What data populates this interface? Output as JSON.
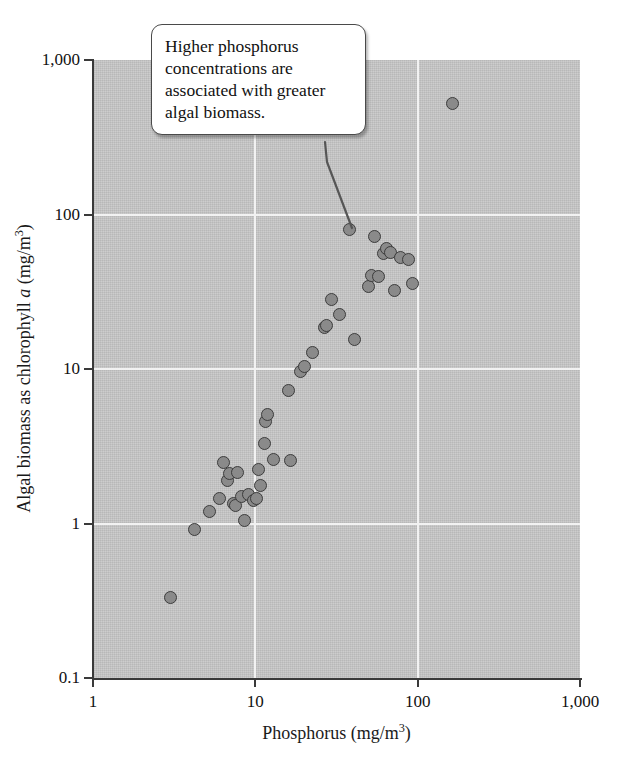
{
  "callout": {
    "text": "Higher phosphorus concentrations are associated with greater algal biomass."
  },
  "axes": {
    "x_title_main": "Phosphorus (mg/m",
    "x_title_sup": "3",
    "x_title_tail": ")",
    "y_title_a": "Algal biomass as chlorophyll ",
    "y_title_ital": "a",
    "y_title_b": " (mg/m",
    "y_title_sup": "3",
    "y_title_tail": ")",
    "x_ticks": [
      "1",
      "10",
      "100",
      "1,000"
    ],
    "y_ticks": [
      "1,000",
      "100",
      "10",
      "1",
      "0.1"
    ]
  },
  "colors": {
    "panel": "#c8c8c8",
    "gridline": "#f2f2f2",
    "marker_fill": "#8a8a8a",
    "marker_edge": "#3c3c3c",
    "axis": "#3a3a3a",
    "callout_bg": "#ffffff",
    "callout_border": "#4a4a4a",
    "text": "#111111"
  },
  "chart_data": {
    "type": "scatter",
    "title": "",
    "xlabel": "Phosphorus (mg/m3)",
    "ylabel": "Algal biomass as chlorophyll a (mg/m3)",
    "xscale": "log",
    "yscale": "log",
    "xlim": [
      1,
      1000
    ],
    "ylim": [
      0.1,
      1000
    ],
    "x_ticks": [
      1,
      10,
      100,
      1000
    ],
    "y_ticks": [
      0.1,
      1,
      10,
      100,
      1000
    ],
    "grid": true,
    "legend": "none",
    "series": [
      {
        "name": "Lakes",
        "points": [
          [
            3.0,
            0.33
          ],
          [
            4.2,
            0.92
          ],
          [
            5.2,
            1.2
          ],
          [
            6.0,
            1.45
          ],
          [
            6.4,
            2.5
          ],
          [
            6.7,
            1.9
          ],
          [
            6.9,
            2.1
          ],
          [
            7.3,
            1.35
          ],
          [
            7.6,
            1.3
          ],
          [
            7.8,
            2.15
          ],
          [
            8.2,
            1.5
          ],
          [
            8.6,
            1.05
          ],
          [
            9.1,
            1.55
          ],
          [
            9.8,
            1.4
          ],
          [
            10.2,
            1.45
          ],
          [
            10.5,
            2.25
          ],
          [
            10.8,
            1.75
          ],
          [
            11.4,
            3.3
          ],
          [
            11.6,
            4.6
          ],
          [
            11.9,
            5.1
          ],
          [
            13.0,
            2.6
          ],
          [
            16.5,
            2.55
          ],
          [
            16.0,
            7.3
          ],
          [
            19.0,
            9.6
          ],
          [
            20.0,
            10.4
          ],
          [
            22.5,
            12.8
          ],
          [
            26.5,
            18.5
          ],
          [
            27.5,
            19.0
          ],
          [
            29.5,
            28.0
          ],
          [
            33.0,
            22.5
          ],
          [
            38.0,
            80.0
          ],
          [
            41.0,
            15.5
          ],
          [
            50.0,
            34.0
          ],
          [
            52.0,
            40.0
          ],
          [
            54.0,
            72.0
          ],
          [
            57.0,
            39.5
          ],
          [
            62.0,
            56.0
          ],
          [
            64.0,
            60.0
          ],
          [
            68.0,
            57.0
          ],
          [
            72.0,
            32.0
          ],
          [
            78.0,
            53.0
          ],
          [
            88.0,
            51.0
          ],
          [
            93.0,
            36.0
          ],
          [
            165.0,
            520.0
          ]
        ]
      }
    ]
  }
}
